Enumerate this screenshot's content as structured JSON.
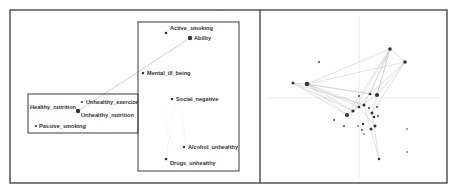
{
  "figure": {
    "outer_frame": {
      "x": 10,
      "y": 10,
      "w": 437,
      "h": 173
    },
    "divider_x": 260,
    "colors": {
      "frame": "#3a3a3a",
      "node": "#333333",
      "edge": "#c8c8c8",
      "axis": "#e6e6e6",
      "text": "#333333"
    }
  },
  "left_panel": {
    "groups": [
      {
        "name": "group-box-right",
        "x": 138,
        "y": 22,
        "w": 101,
        "h": 149
      },
      {
        "name": "group-box-left",
        "x": 28,
        "y": 94,
        "w": 110,
        "h": 39
      }
    ],
    "nodes": [
      {
        "id": "active_smoking",
        "label": "Active_smoking",
        "x": 166,
        "y": 33,
        "r": 1.3,
        "lx": 170,
        "ly": 30
      },
      {
        "id": "ability",
        "label": "Ability",
        "x": 190,
        "y": 38,
        "r": 2.2,
        "lx": 194,
        "ly": 40
      },
      {
        "id": "mental_ill_being",
        "label": "Mental_ill_being",
        "x": 143,
        "y": 73,
        "r": 1.3,
        "lx": 147,
        "ly": 75
      },
      {
        "id": "social_negative",
        "label": "Social_negative",
        "x": 172,
        "y": 99,
        "r": 1.3,
        "lx": 176,
        "ly": 101
      },
      {
        "id": "alcohol_unhealthy",
        "label": "Alcohol_unhealthy",
        "x": 184,
        "y": 147,
        "r": 1.2,
        "lx": 188,
        "ly": 149
      },
      {
        "id": "drugs_unhealthy",
        "label": "Drugs_unhealthy",
        "x": 166,
        "y": 159,
        "r": 1.3,
        "lx": 170,
        "ly": 165
      },
      {
        "id": "unhealthy_exercise",
        "label": "Unhealthy_exercize",
        "x": 82,
        "y": 102,
        "r": 1.1,
        "lx": 86,
        "ly": 104
      },
      {
        "id": "healthy_nutrition",
        "label": "Healthy_nutrition",
        "x": 78,
        "y": 111,
        "r": 2.2,
        "lx": 30,
        "ly": 109
      },
      {
        "id": "unhealthy_nutrition",
        "label": "Unhealthy_nutrition",
        "x": 78,
        "y": 111,
        "r": 0,
        "lx": 81,
        "ly": 117
      },
      {
        "id": "passive_smoking",
        "label": "Passive_smoking",
        "x": 36,
        "y": 126,
        "r": 1.1,
        "lx": 39,
        "ly": 128
      }
    ],
    "edges": [
      {
        "from": "healthy_nutrition",
        "to": "ability"
      }
    ],
    "faint_edges": [
      [
        175,
        100,
        166,
        158
      ],
      [
        180,
        102,
        186,
        146
      ],
      [
        160,
        110,
        175,
        150
      ]
    ]
  },
  "right_panel": {
    "axis": {
      "vx": 359,
      "vy_from": 16,
      "vy_to": 178,
      "hy": 98,
      "hx_from": 268,
      "hx_to": 440
    },
    "nodes": [
      {
        "x": 390,
        "y": 49,
        "r": 1.8
      },
      {
        "x": 405,
        "y": 62,
        "r": 1.8
      },
      {
        "x": 293,
        "y": 83,
        "r": 1.5
      },
      {
        "x": 307,
        "y": 84,
        "r": 2.3
      },
      {
        "x": 319,
        "y": 62,
        "r": 0.9
      },
      {
        "x": 370,
        "y": 94,
        "r": 1.3
      },
      {
        "x": 377,
        "y": 95,
        "r": 2.0
      },
      {
        "x": 359,
        "y": 96,
        "r": 0.9
      },
      {
        "x": 364,
        "y": 105,
        "r": 1.5
      },
      {
        "x": 359,
        "y": 107,
        "r": 1.3
      },
      {
        "x": 353,
        "y": 111,
        "r": 1.6
      },
      {
        "x": 347,
        "y": 115,
        "r": 2.0
      },
      {
        "x": 369,
        "y": 108,
        "r": 0.9
      },
      {
        "x": 377,
        "y": 107,
        "r": 0.9
      },
      {
        "x": 372,
        "y": 113,
        "r": 1.5
      },
      {
        "x": 374,
        "y": 117,
        "r": 1.3
      },
      {
        "x": 378,
        "y": 116,
        "r": 0.9
      },
      {
        "x": 334,
        "y": 120,
        "r": 0.9
      },
      {
        "x": 344,
        "y": 126,
        "r": 0.9
      },
      {
        "x": 363,
        "y": 124,
        "r": 1.2
      },
      {
        "x": 358,
        "y": 126,
        "r": 0.8
      },
      {
        "x": 375,
        "y": 126,
        "r": 1.5
      },
      {
        "x": 362,
        "y": 130,
        "r": 0.9
      },
      {
        "x": 371,
        "y": 129,
        "r": 1.5
      },
      {
        "x": 364,
        "y": 134,
        "r": 0.8
      },
      {
        "x": 379,
        "y": 159,
        "r": 1.3
      },
      {
        "x": 407,
        "y": 129,
        "r": 0.8
      },
      {
        "x": 407,
        "y": 152,
        "r": 0.8
      }
    ],
    "edges": [
      [
        307,
        84,
        390,
        49
      ],
      [
        307,
        84,
        405,
        62
      ],
      [
        390,
        49,
        405,
        62
      ],
      [
        293,
        83,
        307,
        84
      ],
      [
        307,
        84,
        370,
        94
      ],
      [
        307,
        84,
        377,
        95
      ],
      [
        307,
        84,
        364,
        105
      ],
      [
        307,
        84,
        359,
        107
      ],
      [
        307,
        84,
        353,
        111
      ],
      [
        307,
        84,
        347,
        115
      ],
      [
        293,
        83,
        347,
        115
      ],
      [
        293,
        83,
        353,
        111
      ],
      [
        293,
        83,
        364,
        105
      ],
      [
        390,
        49,
        370,
        94
      ],
      [
        390,
        49,
        377,
        95
      ],
      [
        390,
        49,
        364,
        105
      ],
      [
        390,
        49,
        353,
        111
      ],
      [
        390,
        49,
        372,
        113
      ],
      [
        390,
        49,
        347,
        115
      ],
      [
        405,
        62,
        377,
        95
      ],
      [
        405,
        62,
        370,
        94
      ],
      [
        405,
        62,
        372,
        113
      ],
      [
        364,
        105,
        379,
        159
      ],
      [
        372,
        113,
        379,
        159
      ],
      [
        359,
        107,
        375,
        126
      ],
      [
        377,
        95,
        347,
        115
      ],
      [
        370,
        94,
        353,
        111
      ]
    ]
  }
}
